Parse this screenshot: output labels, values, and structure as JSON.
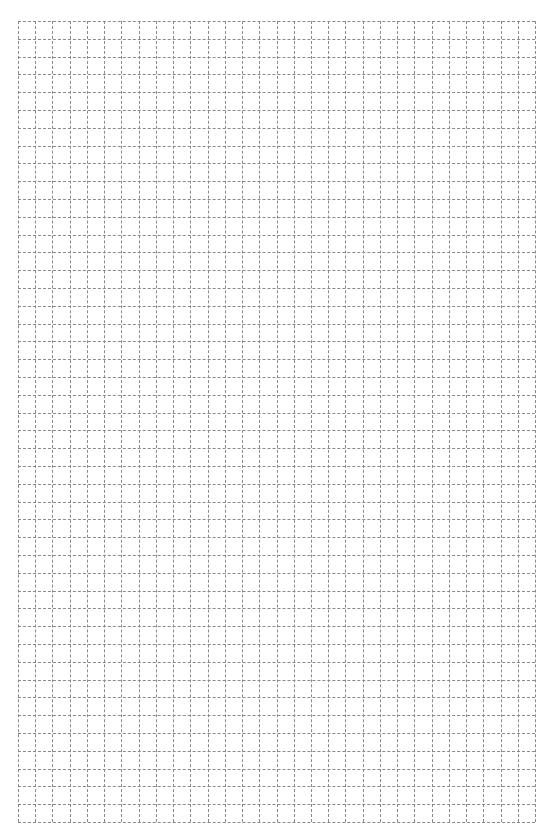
{
  "page": {
    "type": "grid-paper",
    "background": "#ffffff",
    "line_color": "#8a8a8a",
    "line_style": "dashed",
    "columns": 30,
    "rows": 45
  }
}
